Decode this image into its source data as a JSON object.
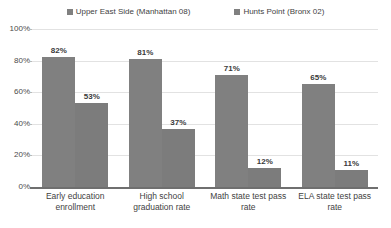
{
  "chart_data": {
    "type": "bar",
    "title": "",
    "xlabel": "",
    "ylabel": "",
    "ylim": [
      0,
      100
    ],
    "yticks": [
      "0%",
      "20%",
      "40%",
      "60%",
      "80%",
      "100%"
    ],
    "ytick_values": [
      0,
      20,
      40,
      60,
      80,
      100
    ],
    "grid": true,
    "legend_position": "top-center",
    "categories": [
      "Early education enrollment",
      "High school graduation rate",
      "Math state test pass rate",
      "ELA state test pass rate"
    ],
    "series": [
      {
        "name": "Upper East Side (Manhattan 08)",
        "color": "#808080",
        "values": [
          82,
          81,
          71,
          65
        ],
        "labels": [
          "82%",
          "81%",
          "71%",
          "65%"
        ]
      },
      {
        "name": "Hunts Point (Bronx 02)",
        "color": "#7c7c7c",
        "values": [
          53,
          37,
          12,
          11
        ],
        "labels": [
          "53%",
          "37%",
          "12%",
          "11%"
        ]
      }
    ]
  },
  "legend": {
    "items": [
      {
        "label": "Upper East Side (Manhattan 08)",
        "swatch": "legend-swatch-icon"
      },
      {
        "label": "Hunts Point (Bronx 02)",
        "swatch": "legend-swatch-icon"
      }
    ]
  }
}
